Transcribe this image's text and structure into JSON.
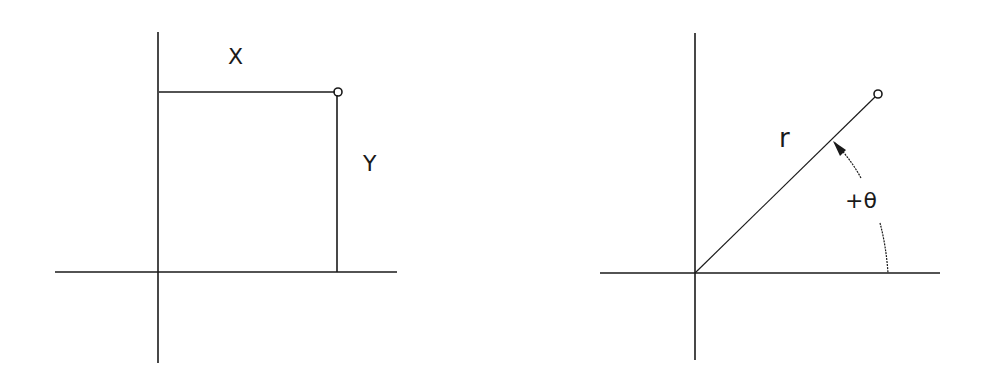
{
  "cartesian": {
    "x_label": "X",
    "y_label": "Y",
    "point_marker": "open-circle"
  },
  "polar": {
    "r_label": "r",
    "theta_label": "+θ",
    "point_marker": "open-circle"
  },
  "colors": {
    "line": "#1a1a1a",
    "background": "#ffffff"
  }
}
